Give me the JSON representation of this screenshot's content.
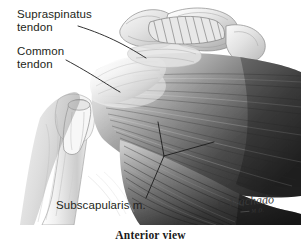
{
  "figure": {
    "caption": "Anterior view",
    "artist_signature": "C.Machado",
    "artist_credential": "M.D.",
    "palette": {
      "background": "#ffffff",
      "ink": "#231f20",
      "leader_line": "#1c1c1c",
      "bone_light": "#f2f2f2",
      "bone_mid": "#cfcfcf",
      "tendon_light": "#ededed",
      "muscle_mid": "#9a9a9a",
      "muscle_dark": "#3c3c3c",
      "muscle_deep": "#1f1f1f"
    }
  },
  "labels": [
    {
      "id": "supraspinatus",
      "line1": "Supraspinatus",
      "line2": "tendon",
      "text": "Supraspinatus tendon"
    },
    {
      "id": "common-tendon",
      "line1": "Common",
      "line2": "tendon",
      "text": "Common tendon"
    },
    {
      "id": "subscapularis",
      "line1": "Subscapularis m.",
      "text": "Subscapularis m."
    }
  ],
  "structures": [
    "acromion",
    "clavicle",
    "coracoacromial ligament",
    "humeral head",
    "humerus shaft",
    "biceps tendon stump",
    "pectoralis major muscle",
    "subscapularis muscle"
  ]
}
